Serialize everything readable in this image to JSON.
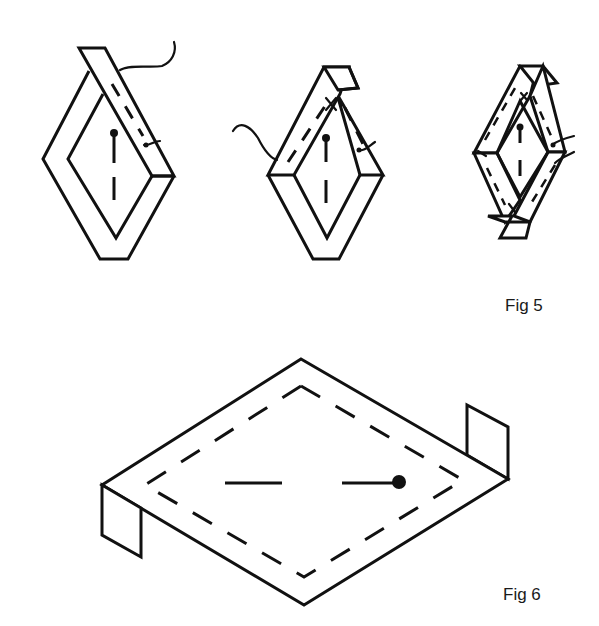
{
  "figures": [
    {
      "label": "Fig 5",
      "description": "Three steps of folding a fabric strip around a diamond-shaped template and basting it in place",
      "steps": [
        {
          "step": 1,
          "description": "Strip folded over one top edge of diamond, pinned, thread attached"
        },
        {
          "step": 2,
          "description": "Second edge folded, strip tacked at corner, thread across"
        },
        {
          "step": 3,
          "description": "All four edges folded and basted with corner flaps"
        }
      ]
    },
    {
      "label": "Fig 6",
      "description": "Isometric view of flat diamond piece with dashed basting line around perimeter, pin in center and two folded tabs at side corners"
    }
  ],
  "colors": {
    "line": "#111111",
    "background": "#ffffff"
  }
}
